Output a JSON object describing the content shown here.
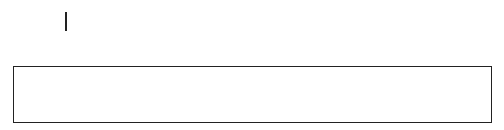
{
  "top_row": [
    {
      "base": "N",
      "sub": "1"
    },
    {
      "base": "N",
      "sub": "2"
    },
    {
      "base": "N",
      "sub": "3"
    },
    {
      "base": "N",
      "sub": "4"
    },
    {
      "base": "N",
      "sub": "5"
    },
    {
      "base": "N",
      "sub": "6"
    },
    {
      "base": "N",
      "sub": "7"
    },
    {
      "base": "N",
      "sub": "8"
    }
  ],
  "table": {
    "columns": [
      {
        "top": {
          "base": "2",
          "sub": ""
        },
        "bottom": "0",
        "shade": "dark"
      },
      {
        "top": {
          "base": "C",
          "sub": "2"
        },
        "bottom": "N:2",
        "shade": "light"
      },
      {
        "top": {
          "base": "C",
          "sub": "3"
        },
        "bottom": "N:3",
        "shade": "light"
      },
      {
        "top": {
          "base": "3",
          "sub": ""
        },
        "bottom": "T:1",
        "shade": "dark"
      },
      {
        "top": {
          "base": "C",
          "sub": "4"
        },
        "bottom": "N:4",
        "shade": "light"
      },
      {
        "top": {
          "base": "C",
          "sub": "5"
        },
        "bottom": "N:5",
        "shade": "light"
      },
      {
        "top": {
          "base": "C",
          "sub": "6"
        },
        "bottom": "N:8",
        "shade": "light"
      },
      {
        "top": {
          "base": "2",
          "sub": ""
        },
        "bottom": "T:5",
        "shade": "dark"
      },
      {
        "top": {
          "base": "C",
          "sub": "4"
        },
        "bottom": "N:6",
        "shade": "light"
      },
      {
        "top": {
          "base": "C",
          "sub": "5"
        },
        "bottom": "N:7",
        "shade": "light"
      },
      {
        "top": {
          "base": "0",
          "sub": ""
        },
        "bottom": "T:2",
        "shade": "dark"
      },
      {
        "top": {
          "base": "0",
          "sub": ""
        },
        "bottom": "T:3",
        "shade": "dark"
      },
      {
        "top": {
          "base": "0",
          "sub": ""
        },
        "bottom": "T:6",
        "shade": "dark"
      },
      {
        "top": {
          "base": "0",
          "sub": ""
        },
        "bottom": "T:7",
        "shade": "dark"
      },
      {
        "top": {
          "base": "0",
          "sub": ""
        },
        "bottom": "T:8",
        "shade": "dark"
      }
    ]
  },
  "arrows": [
    {
      "from": "N1",
      "to_column": 1
    },
    {
      "from": "N2",
      "to_column": 4
    },
    {
      "from": "N3",
      "to_column": 8
    },
    {
      "from": "N4",
      "to_column": 11
    },
    {
      "from": "N5",
      "to_column": 12
    },
    {
      "from": "N6",
      "to_column": 13
    },
    {
      "from": "N7",
      "to_column": 14
    },
    {
      "from": "N8",
      "to_column": 15
    }
  ],
  "colors": {
    "dark_cell": "#a9a9a9",
    "light_cell": "#dcdcdc",
    "line": "#222222"
  }
}
